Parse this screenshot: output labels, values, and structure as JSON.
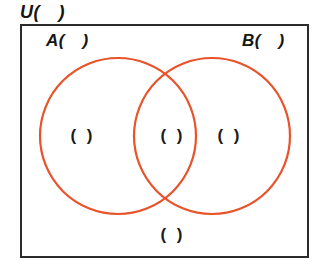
{
  "diagram": {
    "type": "venn-two-set",
    "title_label": "U( )",
    "universe": {
      "name": "universe-rectangle",
      "label": "U( )",
      "border_color": "#2b2b2b",
      "fill_color": "#ffffff"
    },
    "sets": [
      {
        "key": "A",
        "label": "A( )",
        "circle_color": "#e8532a",
        "center_x": 118,
        "center_y": 136,
        "radius": 78
      },
      {
        "key": "B",
        "label": "B( )",
        "circle_color": "#e8532a",
        "center_x": 212,
        "center_y": 136,
        "radius": 78
      }
    ],
    "regions": [
      {
        "key": "only-a",
        "label": "( )"
      },
      {
        "key": "intersect",
        "label": "( )"
      },
      {
        "key": "only-b",
        "label": "( )"
      },
      {
        "key": "complement",
        "label": "( )"
      }
    ]
  },
  "colors": {
    "circle_stroke": "#e8532a",
    "box_stroke": "#2b2b2b",
    "text": "#151515",
    "background": "#ffffff"
  }
}
